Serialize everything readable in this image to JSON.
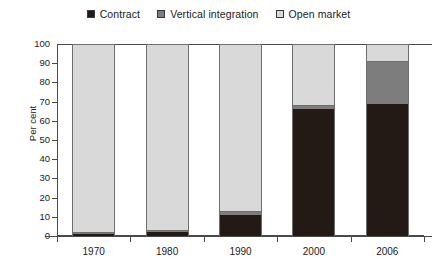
{
  "legend": {
    "entries": [
      {
        "label": "Contract",
        "key": "contract",
        "color": "#231a16"
      },
      {
        "label": "Vertical integration",
        "key": "vertical",
        "color": "#7d7d7d"
      },
      {
        "label": "Open market",
        "key": "open",
        "color": "#d9d9d9"
      }
    ]
  },
  "axes": {
    "ylabel": "Per cent",
    "xlabel": "",
    "yticks": [
      "0",
      "10",
      "20",
      "30",
      "40",
      "50",
      "60",
      "70",
      "80",
      "90",
      "100"
    ]
  },
  "chart_data": {
    "type": "bar",
    "subtype": "stacked-vertical",
    "title": "",
    "xlabel": "",
    "ylabel": "Per cent",
    "ylim": [
      0,
      100
    ],
    "ytick_step": 10,
    "grid": false,
    "legend_position": "top-center",
    "categories": [
      "1970",
      "1980",
      "1990",
      "2000",
      "2006"
    ],
    "series": [
      {
        "name": "Contract",
        "color": "#231a16",
        "values": [
          1,
          2,
          11,
          66,
          69
        ]
      },
      {
        "name": "Vertical integration",
        "color": "#7d7d7d",
        "values": [
          1,
          1,
          2,
          2,
          22
        ]
      },
      {
        "name": "Open market",
        "color": "#d9d9d9",
        "values": [
          98,
          97,
          87,
          32,
          9
        ]
      }
    ]
  }
}
